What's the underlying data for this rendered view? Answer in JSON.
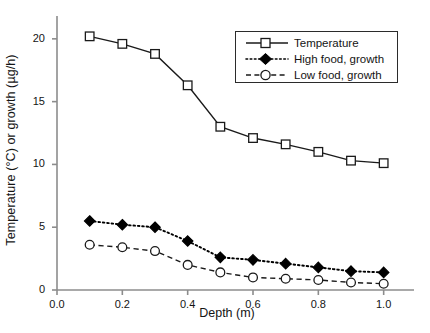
{
  "chart_data": {
    "type": "line",
    "title": "",
    "xlabel": "Depth (m)",
    "ylabel": "Temperature (°C) or growth (µg/h)",
    "x": [
      0.1,
      0.2,
      0.3,
      0.4,
      0.5,
      0.6,
      0.7,
      0.8,
      0.9,
      1.0
    ],
    "xlim": [
      0.0,
      1.05
    ],
    "ylim": [
      0,
      21.5
    ],
    "xticks": [
      "0.0",
      "0.2",
      "0.4",
      "0.6",
      "0.8",
      "1.0"
    ],
    "xtick_values": [
      0.0,
      0.2,
      0.4,
      0.6,
      0.8,
      1.0
    ],
    "yticks": [
      "0",
      "5",
      "10",
      "15",
      "20"
    ],
    "ytick_values": [
      0,
      5,
      10,
      15,
      20
    ],
    "grid": false,
    "legend_position": "top-right",
    "series": [
      {
        "name": "Temperature",
        "values": [
          20.2,
          19.6,
          18.8,
          16.3,
          13.0,
          12.1,
          11.6,
          11.0,
          10.3,
          10.1
        ],
        "line_style": "solid",
        "marker": "open-square",
        "color": "#1a1a1a"
      },
      {
        "name": "High food, growth",
        "values": [
          5.5,
          5.2,
          5.0,
          3.9,
          2.6,
          2.4,
          2.1,
          1.8,
          1.5,
          1.4
        ],
        "line_style": "dotted",
        "marker": "filled-diamond",
        "color": "#000000"
      },
      {
        "name": "Low food, growth",
        "values": [
          3.6,
          3.4,
          3.1,
          2.0,
          1.4,
          1.0,
          0.9,
          0.8,
          0.6,
          0.5
        ],
        "line_style": "dashed",
        "marker": "open-circle",
        "color": "#1a1a1a"
      }
    ]
  },
  "legend": {
    "entries": [
      {
        "label": "Temperature"
      },
      {
        "label": "High food, growth"
      },
      {
        "label": "Low food, growth"
      }
    ]
  },
  "axes": {
    "x_title": "Depth (m)",
    "y_title": "Temperature (°C) or growth (µg/h)",
    "x_tick_labels": [
      "0.0",
      "0.2",
      "0.4",
      "0.6",
      "0.8",
      "1.0"
    ],
    "y_tick_labels": [
      "0",
      "5",
      "10",
      "15",
      "20"
    ]
  },
  "colors": {
    "axis": "#8c8c8c",
    "ink": "#1a1a1a",
    "background": "#ffffff",
    "marker_fill_open": "#ffffff",
    "marker_fill_solid": "#000000"
  }
}
